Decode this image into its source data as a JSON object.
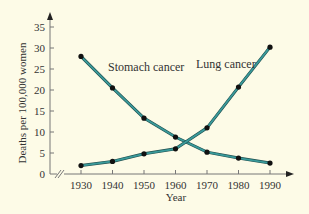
{
  "chart_data": {
    "type": "line",
    "title": "",
    "xlabel": "Year",
    "ylabel": "Deaths per 100,000 women",
    "x": [
      1930,
      1940,
      1950,
      1960,
      1970,
      1980,
      1990
    ],
    "ylim": [
      0,
      35
    ],
    "yticks": [
      0,
      5,
      10,
      15,
      20,
      25,
      30,
      35
    ],
    "xticks": [
      1930,
      1940,
      1950,
      1960,
      1970,
      1980,
      1990
    ],
    "grid": false,
    "axis_break_x": true,
    "series": [
      {
        "name": "Stomach cancer",
        "values": [
          28,
          20.5,
          13.3,
          8.8,
          5.2,
          3.8,
          2.6
        ]
      },
      {
        "name": "Lung cancer",
        "values": [
          2,
          3,
          4.8,
          6,
          11,
          20.7,
          30.2
        ]
      }
    ]
  },
  "colors": {
    "background": "#fdfbe7",
    "line": "#3a9a9a",
    "line_outline": "#1f4f4f",
    "marker": "#111111",
    "axis": "#777777"
  }
}
